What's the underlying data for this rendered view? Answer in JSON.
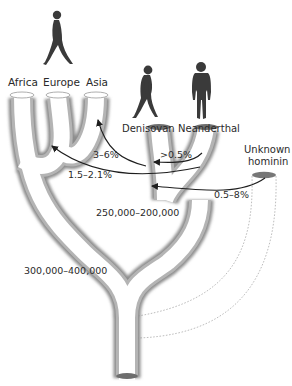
{
  "diagram": {
    "type": "hominin-ancestry-tube-tree",
    "populations": {
      "africa": "Africa",
      "europe": "Europe",
      "asia": "Asia",
      "denisovan": "Denisovan",
      "neanderthal": "Neanderthal",
      "unknown_line1": "Unknown",
      "unknown_line2": "hominin"
    },
    "gene_flow": [
      {
        "label": "3–6%",
        "from": "Denisovan",
        "to": "Asia"
      },
      {
        "label": ">0.5%",
        "from": "Neanderthal",
        "to": "Denisovan"
      },
      {
        "label": "1.5–2.1%",
        "from": "Neanderthal",
        "to": "Modern humans (out of Africa)"
      },
      {
        "label": "0.5–8%",
        "from": "Unknown hominin",
        "to": "Denisovan–Neanderthal ancestor"
      }
    ],
    "dates": {
      "split_denisovan_neanderthal": "250,000–200,000",
      "split_human_archaic": "300,000–400,000"
    },
    "figures": [
      {
        "name": "modern-human-figure",
        "pose": "walking"
      },
      {
        "name": "denisovan-figure",
        "pose": "walking"
      },
      {
        "name": "neanderthal-figure",
        "pose": "standing"
      }
    ],
    "colors": {
      "tube_fill": "#ffffff",
      "tube_edge": "#9a9a9a",
      "tube_shade": "#c8c8c8",
      "cap": "#6e6e6e",
      "arrow": "#1e1e1e",
      "figure": "#3a3a3a",
      "dashed": "#9a9a9a"
    }
  }
}
